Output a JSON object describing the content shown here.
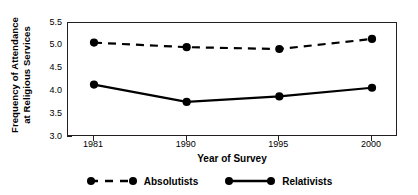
{
  "chart_data": {
    "type": "line",
    "title": "",
    "xlabel": "Year of Survey",
    "ylabel": "Frequency of Attendance at Religious Services",
    "ylabel_line1": "Frequency of Attendance",
    "ylabel_line2": "at Religious Services",
    "categories": [
      "1981",
      "1990",
      "1995",
      "2000"
    ],
    "x": [
      1981,
      1990,
      1995,
      2000
    ],
    "ylim": [
      3.0,
      5.5
    ],
    "yticks": [
      "3.0",
      "3.5",
      "4.0",
      "4.5",
      "5.0",
      "5.5"
    ],
    "ytick_values": [
      3.0,
      3.5,
      4.0,
      4.5,
      5.0,
      5.5
    ],
    "grid": false,
    "legend_position": "bottom-center",
    "series": [
      {
        "name": "Absolutists",
        "style": "dashed",
        "marker": "filled-circle",
        "color": "#000000",
        "values": [
          5.07,
          4.97,
          4.93,
          5.15
        ]
      },
      {
        "name": "Relativists",
        "style": "solid",
        "marker": "filled-circle",
        "color": "#000000",
        "values": [
          4.15,
          3.77,
          3.89,
          4.08
        ]
      }
    ]
  },
  "legend": {
    "entries": [
      {
        "label": "Absolutists"
      },
      {
        "label": "Relativists"
      }
    ]
  }
}
